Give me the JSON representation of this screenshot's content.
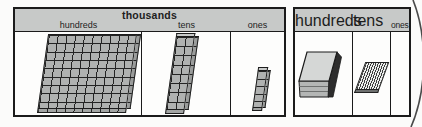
{
  "left_table": {
    "group_label": "thousands",
    "columns": [
      {
        "label": "hundreds",
        "block": "flat-100-block"
      },
      {
        "label": "tens",
        "block": "rod-10-block"
      },
      {
        "label": "ones",
        "block": "cube-stack-block"
      }
    ]
  },
  "right_table": {
    "columns": [
      {
        "label": "hundreds",
        "block": "slab-flat-block"
      },
      {
        "label": "tens",
        "block": "striped-rod-block"
      },
      {
        "label": "ones",
        "block": ""
      }
    ]
  },
  "colors": {
    "header_bg": "#c7c9c8",
    "line": "#1b1b1b",
    "block_fill": "#b0b2b1",
    "slab_top": "#d5d7d6",
    "slab_front": "#b4b6b5",
    "slab_side": "#2d2d2d",
    "background": "#fbfbfa"
  }
}
